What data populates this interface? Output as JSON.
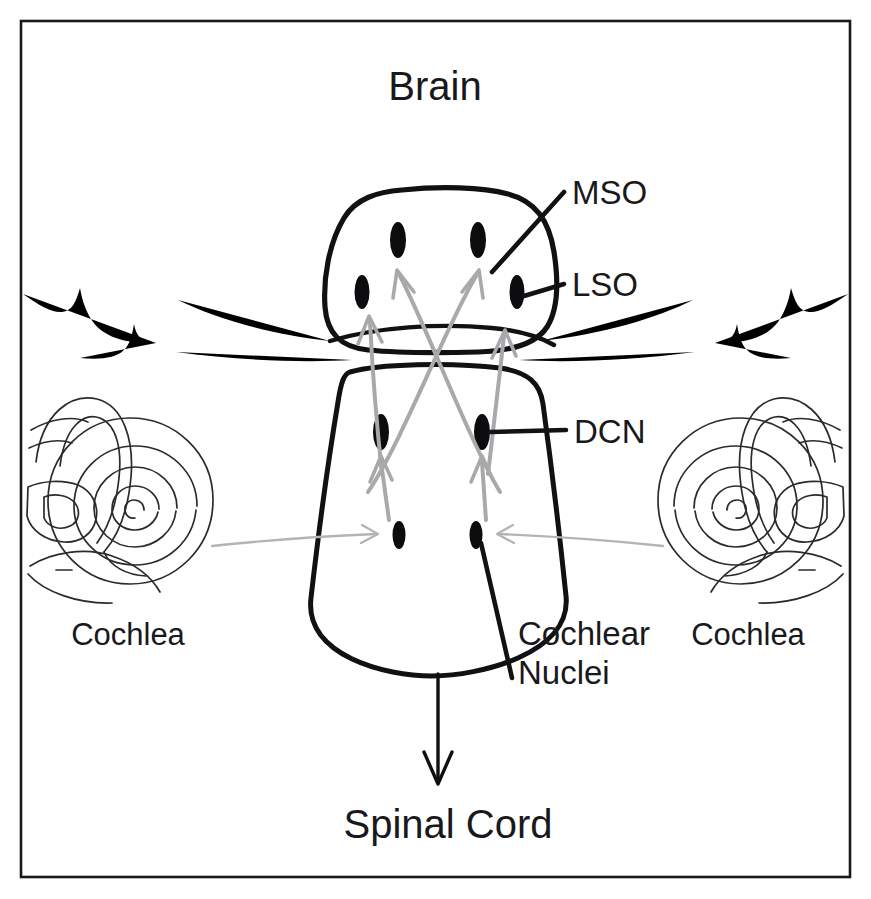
{
  "figure": {
    "kind": "anatomical-diagram",
    "background_color": "#ffffff",
    "ink_color": "#111113",
    "pathway_color": "#a9a9ac",
    "border_color": "#18181a"
  },
  "titles": {
    "top": "Brain",
    "bottom": "Spinal Cord"
  },
  "labels": {
    "mso": "MSO",
    "lso": "LSO",
    "dcn": "DCN",
    "cochlear_nuclei_line1": "Cochlear",
    "cochlear_nuclei_line2": "Nuclei",
    "cochlea_left": "Cochlea",
    "cochlea_right": "Cochlea"
  },
  "structures": {
    "superior_olivary_complex": {
      "name": "superior-olivary-complex",
      "nuclei": [
        {
          "id": "mso-left",
          "label": "MSO",
          "cx": 398,
          "cy": 240,
          "rx": 8,
          "ry": 18
        },
        {
          "id": "mso-right",
          "label": "MSO",
          "cx": 478,
          "cy": 240,
          "rx": 8,
          "ry": 18
        },
        {
          "id": "lso-left",
          "label": "LSO",
          "cx": 362,
          "cy": 292,
          "rx": 7.5,
          "ry": 17
        },
        {
          "id": "lso-right",
          "label": "LSO",
          "cx": 517,
          "cy": 292,
          "rx": 7.5,
          "ry": 17
        }
      ]
    },
    "brainstem": {
      "name": "brainstem",
      "nuclei": [
        {
          "id": "dcn-left",
          "label": "DCN",
          "cx": 381,
          "cy": 432,
          "rx": 8,
          "ry": 18
        },
        {
          "id": "dcn-right",
          "label": "DCN",
          "cx": 482,
          "cy": 432,
          "rx": 8,
          "ry": 18
        },
        {
          "id": "vcn-left",
          "label": "Cochlear Nuclei",
          "cx": 399,
          "cy": 535,
          "rx": 6.5,
          "ry": 14
        },
        {
          "id": "vcn-right",
          "label": "Cochlear Nuclei",
          "cx": 476,
          "cy": 535,
          "rx": 6.5,
          "ry": 14
        }
      ]
    },
    "cochlea_left": {
      "name": "cochlea-left",
      "cx": 128,
      "cy": 500
    },
    "cochlea_right": {
      "name": "cochlea-right",
      "cx": 743,
      "cy": 500
    }
  },
  "pathways": [
    {
      "id": "nerve-left-to-vcn",
      "type": "auditory-nerve",
      "from": "cochlea-left",
      "to": "vcn-left",
      "crossing": false
    },
    {
      "id": "nerve-right-to-vcn",
      "type": "auditory-nerve",
      "from": "cochlea-right",
      "to": "vcn-right",
      "crossing": false
    },
    {
      "id": "vcn-left-to-dcn",
      "type": "ascending",
      "from": "vcn-left",
      "to": "dcn-left",
      "crossing": false
    },
    {
      "id": "vcn-right-to-dcn",
      "type": "ascending",
      "from": "vcn-right",
      "to": "dcn-right",
      "crossing": false
    },
    {
      "id": "cn-left-to-lso-left",
      "type": "ipsilateral",
      "from": "cn-left",
      "to": "lso-left",
      "crossing": false
    },
    {
      "id": "cn-right-to-lso-right",
      "type": "ipsilateral",
      "from": "cn-right",
      "to": "lso-right",
      "crossing": false
    },
    {
      "id": "cn-left-to-mso-right",
      "type": "contralateral",
      "from": "cn-left",
      "to": "mso-right",
      "crossing": true
    },
    {
      "id": "cn-right-to-mso-left",
      "type": "contralateral",
      "from": "cn-right",
      "to": "mso-left",
      "crossing": true
    }
  ]
}
